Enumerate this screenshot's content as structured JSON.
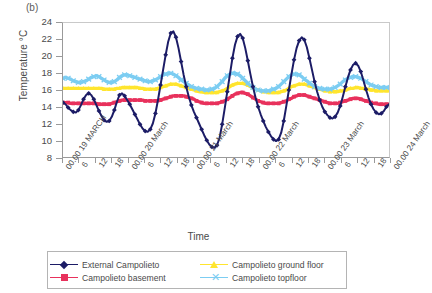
{
  "figure": {
    "panel_label": "(b)",
    "xlabel": "Time",
    "ylabel": "Temperature °C"
  },
  "legend": {
    "items": [
      {
        "label": "External Campolieto",
        "color": "#1c1c66",
        "marker": "diamond"
      },
      {
        "label": "Campolieto ground floor",
        "color": "#ffe52e",
        "marker": "triangle"
      },
      {
        "label": "Campolieto basement",
        "color": "#e8315c",
        "marker": "square"
      },
      {
        "label": "Campolieto topfloor",
        "color": "#7ccdf2",
        "marker": "star"
      }
    ]
  },
  "chart_data": {
    "type": "line",
    "title": "",
    "subtitle": "",
    "xlabel": "Time",
    "ylabel": "Temperature °C",
    "ylim": [
      8,
      24
    ],
    "yticks": [
      8,
      10,
      12,
      14,
      16,
      18,
      20,
      22,
      24
    ],
    "grid": false,
    "legend_position": "bottom",
    "x_tick_labels": [
      "00.00 19 MARCH",
      "6",
      "12",
      "18",
      "00.00 20 March",
      "6",
      "12",
      "18",
      "00.00 21 March",
      "6",
      "12",
      "18",
      "00.00 22 March",
      "6",
      "12",
      "18",
      "00.00 23 March",
      "6",
      "12",
      "18",
      "00.00 24 March"
    ],
    "x_major_indices": [
      0,
      4,
      8,
      12,
      16,
      20
    ],
    "x_index_range": [
      0,
      20
    ],
    "x_units": "6-hour intervals",
    "series": [
      {
        "name": "External Campolieto",
        "color": "#1c1c66",
        "marker": "diamond",
        "values": [
          14.5,
          14.3,
          13.9,
          13.6,
          13.4,
          13.3,
          13.6,
          14.2,
          14.9,
          15.4,
          15.6,
          15.4,
          14.9,
          14.2,
          13.5,
          12.9,
          12.4,
          12.2,
          12.3,
          12.8,
          13.6,
          14.6,
          15.4,
          15.6,
          15.3,
          14.8,
          14.3,
          13.7,
          13.1,
          12.5,
          11.9,
          11.4,
          11.1,
          11.0,
          11.3,
          12.0,
          13.2,
          14.8,
          16.6,
          18.4,
          20.2,
          21.8,
          22.8,
          23.0,
          22.3,
          21.0,
          19.4,
          17.8,
          16.4,
          15.2,
          14.2,
          13.4,
          12.7,
          12.0,
          11.3,
          10.6,
          10.0,
          9.5,
          9.2,
          9.1,
          9.4,
          10.3,
          11.9,
          13.8,
          15.8,
          17.8,
          19.8,
          21.4,
          22.4,
          22.7,
          22.2,
          21.0,
          19.5,
          17.9,
          16.4,
          15.1,
          14.0,
          13.1,
          12.3,
          11.6,
          11.0,
          10.5,
          10.1,
          9.9,
          10.1,
          10.9,
          12.3,
          14.1,
          16.0,
          17.9,
          19.6,
          21.0,
          21.9,
          22.3,
          22.0,
          21.1,
          19.8,
          18.4,
          17.0,
          15.8,
          14.8,
          14.0,
          13.4,
          13.0,
          12.7,
          12.6,
          12.8,
          13.3,
          14.1,
          15.2,
          16.4,
          17.5,
          18.4,
          19.0,
          19.2,
          18.9,
          18.2,
          17.2,
          16.1,
          15.1,
          14.3,
          13.7,
          13.3,
          13.1,
          13.2,
          13.5,
          14.0,
          14.3
        ]
      },
      {
        "name": "Campolieto basement",
        "color": "#e8315c",
        "marker": "square",
        "values": [
          14.5,
          14.5,
          14.5,
          14.4,
          14.4,
          14.4,
          14.4,
          14.4,
          14.4,
          14.4,
          14.4,
          14.4,
          14.4,
          14.4,
          14.3,
          14.3,
          14.3,
          14.3,
          14.3,
          14.4,
          14.5,
          14.6,
          14.7,
          14.8,
          14.8,
          14.8,
          14.8,
          14.8,
          14.8,
          14.8,
          14.8,
          14.8,
          14.7,
          14.7,
          14.7,
          14.7,
          14.7,
          14.7,
          14.8,
          14.9,
          15.0,
          15.1,
          15.2,
          15.3,
          15.3,
          15.3,
          15.3,
          15.3,
          15.2,
          15.1,
          15.0,
          14.9,
          14.7,
          14.6,
          14.5,
          14.4,
          14.4,
          14.4,
          14.4,
          14.4,
          14.4,
          14.5,
          14.6,
          14.7,
          14.9,
          15.1,
          15.3,
          15.5,
          15.6,
          15.7,
          15.7,
          15.6,
          15.5,
          15.3,
          15.1,
          14.9,
          14.7,
          14.6,
          14.5,
          14.4,
          14.4,
          14.4,
          14.4,
          14.4,
          14.4,
          14.5,
          14.6,
          14.7,
          14.9,
          15.0,
          15.2,
          15.3,
          15.4,
          15.4,
          15.4,
          15.3,
          15.2,
          15.1,
          15.0,
          14.9,
          14.8,
          14.7,
          14.6,
          14.5,
          14.4,
          14.4,
          14.4,
          14.4,
          14.5,
          14.6,
          14.7,
          14.8,
          14.9,
          15.0,
          15.0,
          15.0,
          14.9,
          14.8,
          14.7,
          14.6,
          14.5,
          14.4,
          14.4,
          14.3,
          14.3,
          14.3,
          14.3,
          14.3
        ]
      },
      {
        "name": "Campolieto ground floor",
        "color": "#ffe52e",
        "marker": "triangle",
        "values": [
          16.2,
          16.2,
          16.2,
          16.2,
          16.2,
          16.2,
          16.2,
          16.2,
          16.2,
          16.2,
          16.2,
          16.2,
          16.2,
          16.2,
          16.2,
          16.2,
          16.1,
          16.1,
          16.1,
          16.1,
          16.1,
          16.2,
          16.2,
          16.3,
          16.3,
          16.3,
          16.3,
          16.3,
          16.3,
          16.3,
          16.2,
          16.2,
          16.1,
          16.1,
          16.1,
          16.1,
          16.1,
          16.2,
          16.3,
          16.4,
          16.5,
          16.6,
          16.7,
          16.7,
          16.7,
          16.6,
          16.5,
          16.4,
          16.3,
          16.2,
          16.1,
          16.0,
          15.9,
          15.8,
          15.8,
          15.7,
          15.7,
          15.7,
          15.7,
          15.7,
          15.7,
          15.8,
          15.9,
          16.0,
          16.2,
          16.4,
          16.6,
          16.7,
          16.8,
          16.8,
          16.8,
          16.7,
          16.6,
          16.4,
          16.3,
          16.1,
          16.0,
          15.9,
          15.8,
          15.8,
          15.7,
          15.7,
          15.7,
          15.7,
          15.7,
          15.8,
          15.9,
          16.0,
          16.2,
          16.4,
          16.5,
          16.6,
          16.7,
          16.7,
          16.7,
          16.6,
          16.5,
          16.4,
          16.3,
          16.2,
          16.1,
          16.0,
          15.9,
          15.9,
          15.8,
          15.8,
          15.8,
          15.8,
          15.9,
          15.9,
          16.0,
          16.1,
          16.2,
          16.2,
          16.3,
          16.3,
          16.2,
          16.2,
          16.1,
          16.1,
          16.0,
          16.0,
          15.9,
          15.9,
          15.9,
          15.9,
          15.9,
          15.9
        ]
      },
      {
        "name": "Campolieto topfloor",
        "color": "#7ccdf2",
        "marker": "star",
        "values": [
          17.4,
          17.5,
          17.4,
          17.3,
          17.1,
          17.0,
          16.9,
          16.9,
          17.0,
          17.1,
          17.3,
          17.5,
          17.6,
          17.7,
          17.6,
          17.4,
          17.2,
          17.0,
          16.9,
          16.9,
          17.0,
          17.2,
          17.5,
          17.7,
          17.8,
          17.8,
          17.7,
          17.6,
          17.5,
          17.4,
          17.3,
          17.2,
          17.1,
          17.0,
          17.0,
          17.1,
          17.2,
          17.4,
          17.6,
          17.8,
          17.9,
          18.0,
          18.0,
          17.9,
          17.7,
          17.5,
          17.2,
          17.0,
          16.8,
          16.6,
          16.4,
          16.3,
          16.2,
          16.1,
          16.1,
          16.0,
          16.0,
          16.0,
          16.1,
          16.2,
          16.4,
          16.7,
          17.0,
          17.4,
          17.7,
          17.9,
          18.0,
          18.0,
          17.9,
          17.7,
          17.4,
          17.1,
          16.8,
          16.5,
          16.3,
          16.1,
          16.0,
          15.9,
          15.9,
          15.9,
          15.9,
          16.0,
          16.1,
          16.2,
          16.4,
          16.7,
          17.0,
          17.3,
          17.6,
          17.8,
          17.9,
          17.9,
          17.8,
          17.6,
          17.3,
          17.1,
          16.8,
          16.6,
          16.4,
          16.3,
          16.2,
          16.1,
          16.1,
          16.1,
          16.1,
          16.2,
          16.3,
          16.5,
          16.7,
          17.0,
          17.2,
          17.4,
          17.5,
          17.6,
          17.6,
          17.5,
          17.4,
          17.2,
          17.0,
          16.8,
          16.6,
          16.5,
          16.4,
          16.3,
          16.3,
          16.3,
          16.3,
          16.3
        ]
      }
    ]
  }
}
